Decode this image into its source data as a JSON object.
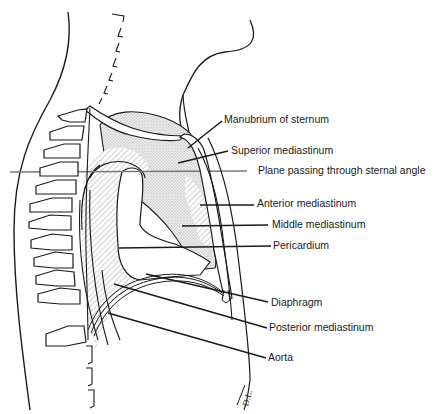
{
  "figure": {
    "colors": {
      "stroke": "#1a1a1a",
      "stipple_fill": "#d9d9d9",
      "hatch": "#8a8a8a",
      "plane_line": "#7a7a7a",
      "background": "#ffffff"
    },
    "labels": [
      {
        "id": "manubrium",
        "text": "Manubrium of sternum"
      },
      {
        "id": "superior",
        "text": "Superior mediastinum"
      },
      {
        "id": "plane",
        "text": "Plane passing through sternal angle"
      },
      {
        "id": "anterior",
        "text": "Anterior mediastinum"
      },
      {
        "id": "middle",
        "text": "Middle mediastinum"
      },
      {
        "id": "pericardium",
        "text": "Pericardium"
      },
      {
        "id": "diaphragm",
        "text": "Diaphragm"
      },
      {
        "id": "posterior",
        "text": "Posterior mediastinum"
      },
      {
        "id": "aorta",
        "text": "Aorta"
      }
    ],
    "signature": "D.L."
  }
}
